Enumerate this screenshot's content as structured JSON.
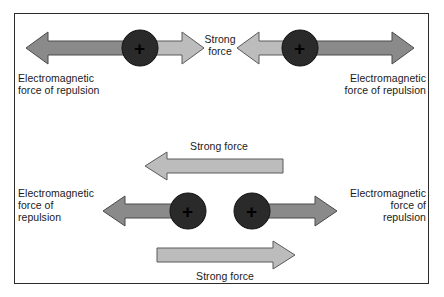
{
  "figure": {
    "border_color": "#2b2b2b",
    "background": "#ffffff"
  },
  "colors": {
    "em_arrow": "#8a8a8a",
    "em_arrow_stroke": "#4a4a4a",
    "strong_arrow": "#bcbcbc",
    "strong_arrow_stroke": "#5a5a5a",
    "particle_fill": "#2a2a2a",
    "particle_stroke": "#111111",
    "text": "#1a1a1a"
  },
  "panels": {
    "top": {
      "name": "far-apart-protons",
      "particles": [
        {
          "label": "+",
          "cx": 140,
          "cy": 48,
          "r": 18
        },
        {
          "label": "+",
          "cx": 300,
          "cy": 48,
          "r": 18
        }
      ],
      "em_left_label": "Electromagnetic\nforce of repulsion",
      "em_right_label": "Electromagnetic\nforce of repulsion",
      "strong_label": "Strong\nforce"
    },
    "bottom": {
      "name": "close-together-protons",
      "particles": [
        {
          "label": "+",
          "cx": 188,
          "cy": 211,
          "r": 18
        },
        {
          "label": "+",
          "cx": 252,
          "cy": 211,
          "r": 18
        }
      ],
      "em_left_label": "Electromagnetic\nforce of\nrepulsion",
      "em_right_label": "Electromagnetic\nforce of\nrepulsion",
      "strong_top_label": "Strong force",
      "strong_bottom_label": "Strong force"
    }
  }
}
